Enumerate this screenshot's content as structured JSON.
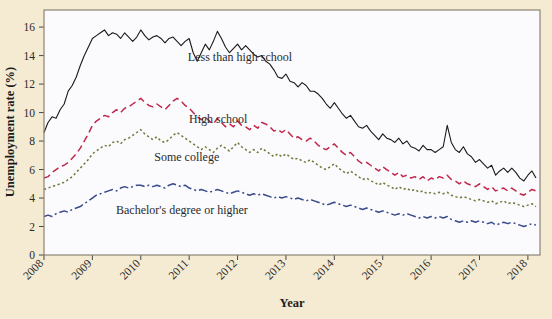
{
  "figure": {
    "background_color": "#f5ead2",
    "plot_background_color": "#fbfbfd",
    "plot_border_color": "#8a8274"
  },
  "chart_data": {
    "type": "line",
    "title": "",
    "xlabel": "Year",
    "ylabel": "Unemployment rate (%)",
    "xlim": [
      2008.0,
      2018.25
    ],
    "ylim": [
      0,
      17.2
    ],
    "yticks": [
      0,
      2,
      4,
      6,
      8,
      10,
      12,
      14,
      16
    ],
    "ytick_labels": [
      "0",
      "2",
      "4",
      "6",
      "8",
      "10",
      "12",
      "14",
      "16"
    ],
    "xticks": [
      2008,
      2009,
      2010,
      2011,
      2012,
      2013,
      2014,
      2015,
      2016,
      2017,
      2018
    ],
    "xtick_labels": [
      "2008",
      "2009",
      "2010",
      "2011",
      "2012",
      "2013",
      "2014",
      "2015",
      "2016",
      "2017",
      "2018"
    ],
    "xtick_rotation": 45,
    "grid": false,
    "legend": "inline-annotations",
    "series": [
      {
        "name": "Less than high school",
        "label": "Less than high school",
        "color": "#1a1a1a",
        "linestyle": "solid",
        "annotation_x": 2012.05,
        "annotation_y": 13.9,
        "x": [
          2008.0,
          2008.083,
          2008.167,
          2008.25,
          2008.333,
          2008.417,
          2008.5,
          2008.583,
          2008.667,
          2008.75,
          2008.833,
          2008.917,
          2009.0,
          2009.083,
          2009.167,
          2009.25,
          2009.333,
          2009.417,
          2009.5,
          2009.583,
          2009.667,
          2009.75,
          2009.833,
          2009.917,
          2010.0,
          2010.083,
          2010.167,
          2010.25,
          2010.333,
          2010.417,
          2010.5,
          2010.583,
          2010.667,
          2010.75,
          2010.833,
          2010.917,
          2011.0,
          2011.083,
          2011.167,
          2011.25,
          2011.333,
          2011.417,
          2011.5,
          2011.583,
          2011.667,
          2011.75,
          2011.833,
          2011.917,
          2012.0,
          2012.083,
          2012.167,
          2012.25,
          2012.333,
          2012.417,
          2012.5,
          2012.583,
          2012.667,
          2012.75,
          2012.833,
          2012.917,
          2013.0,
          2013.083,
          2013.167,
          2013.25,
          2013.333,
          2013.417,
          2013.5,
          2013.583,
          2013.667,
          2013.75,
          2013.833,
          2013.917,
          2014.0,
          2014.083,
          2014.167,
          2014.25,
          2014.333,
          2014.417,
          2014.5,
          2014.583,
          2014.667,
          2014.75,
          2014.833,
          2014.917,
          2015.0,
          2015.083,
          2015.167,
          2015.25,
          2015.333,
          2015.417,
          2015.5,
          2015.583,
          2015.667,
          2015.75,
          2015.833,
          2015.917,
          2016.0,
          2016.083,
          2016.167,
          2016.25,
          2016.333,
          2016.417,
          2016.5,
          2016.583,
          2016.667,
          2016.75,
          2016.833,
          2016.917,
          2017.0,
          2017.083,
          2017.167,
          2017.25,
          2017.333,
          2017.417,
          2017.5,
          2017.583,
          2017.667,
          2017.75,
          2017.833,
          2017.917,
          2018.0,
          2018.083,
          2018.167
        ],
        "y": [
          8.6,
          9.3,
          9.7,
          9.6,
          10.2,
          10.6,
          11.5,
          11.9,
          12.5,
          13.3,
          14.0,
          14.6,
          15.2,
          15.4,
          15.6,
          15.8,
          15.4,
          15.6,
          15.5,
          15.2,
          15.6,
          15.3,
          15.0,
          15.3,
          15.8,
          15.4,
          15.1,
          15.3,
          15.4,
          15.2,
          14.9,
          15.2,
          15.3,
          15.0,
          14.7,
          15.0,
          15.2,
          14.2,
          13.6,
          14.2,
          14.8,
          14.4,
          15.0,
          15.7,
          15.2,
          14.6,
          14.2,
          14.5,
          14.8,
          14.4,
          14.7,
          14.4,
          14.1,
          13.9,
          14.0,
          13.6,
          13.4,
          13.0,
          12.5,
          12.4,
          12.7,
          12.2,
          12.1,
          11.8,
          12.1,
          11.9,
          11.5,
          11.5,
          11.3,
          11.0,
          10.6,
          10.3,
          10.7,
          10.3,
          9.9,
          9.6,
          9.8,
          9.4,
          9.0,
          8.9,
          9.1,
          8.7,
          8.4,
          8.1,
          8.5,
          8.2,
          8.1,
          7.9,
          8.2,
          7.8,
          8.0,
          7.6,
          7.5,
          7.3,
          7.7,
          7.4,
          7.4,
          7.2,
          7.4,
          7.6,
          9.1,
          7.9,
          7.4,
          7.2,
          7.6,
          7.1,
          6.9,
          6.5,
          6.7,
          6.4,
          6.1,
          6.3,
          5.6,
          5.9,
          6.1,
          5.8,
          6.1,
          5.8,
          5.4,
          5.2,
          5.6,
          5.9,
          5.4
        ]
      },
      {
        "name": "High school",
        "label": "High school",
        "color": "#c0284a",
        "linestyle": "dashed",
        "annotation_x": 2011.6,
        "annotation_y": 9.55,
        "x": [
          2008.0,
          2008.083,
          2008.167,
          2008.25,
          2008.333,
          2008.417,
          2008.5,
          2008.583,
          2008.667,
          2008.75,
          2008.833,
          2008.917,
          2009.0,
          2009.083,
          2009.167,
          2009.25,
          2009.333,
          2009.417,
          2009.5,
          2009.583,
          2009.667,
          2009.75,
          2009.833,
          2009.917,
          2010.0,
          2010.083,
          2010.167,
          2010.25,
          2010.333,
          2010.417,
          2010.5,
          2010.583,
          2010.667,
          2010.75,
          2010.833,
          2010.917,
          2011.0,
          2011.083,
          2011.167,
          2011.25,
          2011.333,
          2011.417,
          2011.5,
          2011.583,
          2011.667,
          2011.75,
          2011.833,
          2011.917,
          2012.0,
          2012.083,
          2012.167,
          2012.25,
          2012.333,
          2012.417,
          2012.5,
          2012.583,
          2012.667,
          2012.75,
          2012.833,
          2012.917,
          2013.0,
          2013.083,
          2013.167,
          2013.25,
          2013.333,
          2013.417,
          2013.5,
          2013.583,
          2013.667,
          2013.75,
          2013.833,
          2013.917,
          2014.0,
          2014.083,
          2014.167,
          2014.25,
          2014.333,
          2014.417,
          2014.5,
          2014.583,
          2014.667,
          2014.75,
          2014.833,
          2014.917,
          2015.0,
          2015.083,
          2015.167,
          2015.25,
          2015.333,
          2015.417,
          2015.5,
          2015.583,
          2015.667,
          2015.75,
          2015.833,
          2015.917,
          2016.0,
          2016.083,
          2016.167,
          2016.25,
          2016.333,
          2016.417,
          2016.5,
          2016.583,
          2016.667,
          2016.75,
          2016.833,
          2016.917,
          2017.0,
          2017.083,
          2017.167,
          2017.25,
          2017.333,
          2017.417,
          2017.5,
          2017.583,
          2017.667,
          2017.75,
          2017.833,
          2017.917,
          2018.0,
          2018.083,
          2018.167
        ],
        "y": [
          5.4,
          5.5,
          5.8,
          6.0,
          6.2,
          6.3,
          6.5,
          6.8,
          7.1,
          7.5,
          8.0,
          8.5,
          9.1,
          9.4,
          9.6,
          9.8,
          9.7,
          10.0,
          10.2,
          10.0,
          10.3,
          10.4,
          10.6,
          10.8,
          11.0,
          10.7,
          10.5,
          10.4,
          10.6,
          10.4,
          10.2,
          10.5,
          10.8,
          11.0,
          10.8,
          10.5,
          10.3,
          10.0,
          9.7,
          9.5,
          9.7,
          9.4,
          9.2,
          9.6,
          9.3,
          9.0,
          9.2,
          9.0,
          9.4,
          9.1,
          9.0,
          8.8,
          9.1,
          8.9,
          9.3,
          9.2,
          9.0,
          8.7,
          8.8,
          8.6,
          8.8,
          8.5,
          8.2,
          8.3,
          8.1,
          8.0,
          8.2,
          8.0,
          7.7,
          7.5,
          7.4,
          7.6,
          7.8,
          7.5,
          7.2,
          7.0,
          7.2,
          6.9,
          6.6,
          6.4,
          6.5,
          6.3,
          6.1,
          5.9,
          6.2,
          6.0,
          5.8,
          5.6,
          5.8,
          5.5,
          5.6,
          5.4,
          5.5,
          5.3,
          5.5,
          5.2,
          5.4,
          5.3,
          5.5,
          5.4,
          5.6,
          5.3,
          5.2,
          5.0,
          5.2,
          5.0,
          4.9,
          4.8,
          5.0,
          4.8,
          4.6,
          4.8,
          4.5,
          4.6,
          4.7,
          4.5,
          4.7,
          4.5,
          4.3,
          4.2,
          4.4,
          4.6,
          4.5
        ]
      },
      {
        "name": "Some college",
        "label": "Some college",
        "color": "#6b7a3a",
        "linestyle": "dotted",
        "annotation_x": 2010.95,
        "annotation_y": 6.9,
        "x": [
          2008.0,
          2008.083,
          2008.167,
          2008.25,
          2008.333,
          2008.417,
          2008.5,
          2008.583,
          2008.667,
          2008.75,
          2008.833,
          2008.917,
          2009.0,
          2009.083,
          2009.167,
          2009.25,
          2009.333,
          2009.417,
          2009.5,
          2009.583,
          2009.667,
          2009.75,
          2009.833,
          2009.917,
          2010.0,
          2010.083,
          2010.167,
          2010.25,
          2010.333,
          2010.417,
          2010.5,
          2010.583,
          2010.667,
          2010.75,
          2010.833,
          2010.917,
          2011.0,
          2011.083,
          2011.167,
          2011.25,
          2011.333,
          2011.417,
          2011.5,
          2011.583,
          2011.667,
          2011.75,
          2011.833,
          2011.917,
          2012.0,
          2012.083,
          2012.167,
          2012.25,
          2012.333,
          2012.417,
          2012.5,
          2012.583,
          2012.667,
          2012.75,
          2012.833,
          2012.917,
          2013.0,
          2013.083,
          2013.167,
          2013.25,
          2013.333,
          2013.417,
          2013.5,
          2013.583,
          2013.667,
          2013.75,
          2013.833,
          2013.917,
          2014.0,
          2014.083,
          2014.167,
          2014.25,
          2014.333,
          2014.417,
          2014.5,
          2014.583,
          2014.667,
          2014.75,
          2014.833,
          2014.917,
          2015.0,
          2015.083,
          2015.167,
          2015.25,
          2015.333,
          2015.417,
          2015.5,
          2015.583,
          2015.667,
          2015.75,
          2015.833,
          2015.917,
          2016.0,
          2016.083,
          2016.167,
          2016.25,
          2016.333,
          2016.417,
          2016.5,
          2016.583,
          2016.667,
          2016.75,
          2016.833,
          2016.917,
          2017.0,
          2017.083,
          2017.167,
          2017.25,
          2017.333,
          2017.417,
          2017.5,
          2017.583,
          2017.667,
          2017.75,
          2017.833,
          2017.917,
          2018.0,
          2018.083,
          2018.167
        ],
        "y": [
          4.6,
          4.7,
          4.8,
          4.9,
          5.0,
          5.1,
          5.3,
          5.5,
          5.8,
          6.1,
          6.4,
          6.7,
          7.1,
          7.3,
          7.5,
          7.7,
          7.6,
          7.9,
          8.0,
          7.8,
          8.1,
          8.2,
          8.4,
          8.6,
          8.8,
          8.5,
          8.3,
          8.1,
          8.3,
          8.0,
          7.9,
          8.1,
          8.4,
          8.6,
          8.4,
          8.2,
          8.0,
          7.8,
          7.6,
          7.4,
          7.6,
          7.4,
          7.2,
          7.5,
          7.7,
          7.5,
          7.3,
          7.6,
          7.9,
          7.6,
          7.4,
          7.2,
          7.4,
          7.2,
          7.5,
          7.3,
          7.1,
          6.9,
          7.1,
          6.9,
          7.1,
          6.9,
          6.7,
          6.8,
          6.6,
          6.5,
          6.7,
          6.5,
          6.3,
          6.1,
          6.0,
          6.2,
          6.4,
          6.1,
          5.9,
          5.7,
          5.9,
          5.7,
          5.5,
          5.3,
          5.4,
          5.2,
          5.1,
          4.9,
          5.1,
          4.9,
          4.8,
          4.6,
          4.8,
          4.6,
          4.7,
          4.5,
          4.6,
          4.4,
          4.5,
          4.3,
          4.4,
          4.3,
          4.4,
          4.3,
          4.4,
          4.2,
          4.1,
          4.0,
          4.1,
          4.0,
          3.9,
          3.8,
          3.9,
          3.8,
          3.7,
          3.8,
          3.6,
          3.7,
          3.8,
          3.6,
          3.7,
          3.6,
          3.5,
          3.4,
          3.5,
          3.6,
          3.4
        ]
      },
      {
        "name": "Bachelor's degree or higher",
        "label": "Bachelor's degree or higher",
        "color": "#3b4a8c",
        "linestyle": "dashdot",
        "annotation_x": 2010.85,
        "annotation_y": 3.15,
        "x": [
          2008.0,
          2008.083,
          2008.167,
          2008.25,
          2008.333,
          2008.417,
          2008.5,
          2008.583,
          2008.667,
          2008.75,
          2008.833,
          2008.917,
          2009.0,
          2009.083,
          2009.167,
          2009.25,
          2009.333,
          2009.417,
          2009.5,
          2009.583,
          2009.667,
          2009.75,
          2009.833,
          2009.917,
          2010.0,
          2010.083,
          2010.167,
          2010.25,
          2010.333,
          2010.417,
          2010.5,
          2010.583,
          2010.667,
          2010.75,
          2010.833,
          2010.917,
          2011.0,
          2011.083,
          2011.167,
          2011.25,
          2011.333,
          2011.417,
          2011.5,
          2011.583,
          2011.667,
          2011.75,
          2011.833,
          2011.917,
          2012.0,
          2012.083,
          2012.167,
          2012.25,
          2012.333,
          2012.417,
          2012.5,
          2012.583,
          2012.667,
          2012.75,
          2012.833,
          2012.917,
          2013.0,
          2013.083,
          2013.167,
          2013.25,
          2013.333,
          2013.417,
          2013.5,
          2013.583,
          2013.667,
          2013.75,
          2013.833,
          2013.917,
          2014.0,
          2014.083,
          2014.167,
          2014.25,
          2014.333,
          2014.417,
          2014.5,
          2014.583,
          2014.667,
          2014.75,
          2014.833,
          2014.917,
          2015.0,
          2015.083,
          2015.167,
          2015.25,
          2015.333,
          2015.417,
          2015.5,
          2015.583,
          2015.667,
          2015.75,
          2015.833,
          2015.917,
          2016.0,
          2016.083,
          2016.167,
          2016.25,
          2016.333,
          2016.417,
          2016.5,
          2016.583,
          2016.667,
          2016.75,
          2016.833,
          2016.917,
          2017.0,
          2017.083,
          2017.167,
          2017.25,
          2017.333,
          2017.417,
          2017.5,
          2017.583,
          2017.667,
          2017.75,
          2017.833,
          2017.917,
          2018.0,
          2018.083,
          2018.167
        ],
        "y": [
          2.7,
          2.8,
          2.7,
          2.9,
          3.0,
          3.1,
          3.0,
          3.2,
          3.3,
          3.4,
          3.6,
          3.8,
          4.0,
          4.2,
          4.3,
          4.4,
          4.5,
          4.6,
          4.5,
          4.7,
          4.8,
          4.7,
          4.8,
          4.9,
          4.9,
          4.8,
          4.9,
          4.8,
          4.9,
          4.8,
          4.7,
          4.9,
          5.0,
          4.9,
          4.8,
          4.9,
          4.7,
          4.6,
          4.5,
          4.6,
          4.5,
          4.4,
          4.5,
          4.6,
          4.5,
          4.4,
          4.3,
          4.4,
          4.5,
          4.4,
          4.3,
          4.2,
          4.3,
          4.2,
          4.3,
          4.2,
          4.1,
          4.0,
          4.1,
          4.0,
          4.1,
          4.0,
          3.9,
          4.0,
          3.9,
          3.8,
          3.9,
          3.8,
          3.7,
          3.6,
          3.5,
          3.6,
          3.7,
          3.6,
          3.5,
          3.4,
          3.5,
          3.4,
          3.3,
          3.2,
          3.3,
          3.2,
          3.1,
          3.0,
          3.1,
          3.0,
          2.9,
          2.8,
          2.9,
          2.8,
          2.9,
          2.8,
          2.7,
          2.6,
          2.7,
          2.6,
          2.7,
          2.6,
          2.7,
          2.6,
          2.7,
          2.5,
          2.4,
          2.3,
          2.4,
          2.3,
          2.4,
          2.3,
          2.4,
          2.3,
          2.2,
          2.3,
          2.1,
          2.2,
          2.3,
          2.2,
          2.3,
          2.2,
          2.1,
          2.0,
          2.1,
          2.2,
          2.1
        ]
      }
    ]
  }
}
